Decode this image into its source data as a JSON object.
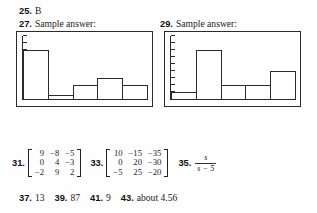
{
  "page": {
    "background_color": "#fefefe",
    "ink_color": "#1c1c1c"
  },
  "entries": {
    "e25": {
      "number": "25.",
      "answer": "B"
    },
    "e27": {
      "number": "27.",
      "answer": "Sample answer:"
    },
    "e29": {
      "number": "29.",
      "answer": "Sample answer:"
    },
    "e31": {
      "number": "31."
    },
    "e33": {
      "number": "33."
    },
    "e35": {
      "number": "35.",
      "numerator": "s",
      "denominator": "s − 5"
    },
    "e37": {
      "number": "37.",
      "answer": "13"
    },
    "e39": {
      "number": "39.",
      "answer": "87"
    },
    "e41": {
      "number": "41.",
      "answer": "9"
    },
    "e43": {
      "number": "43.",
      "answer": "about 4.56"
    }
  },
  "matrices": {
    "m31": {
      "rows": [
        [
          "9",
          "−8",
          "−5"
        ],
        [
          "0",
          "4",
          "−3"
        ],
        [
          "−2",
          "9",
          "2"
        ]
      ]
    },
    "m33": {
      "rows": [
        [
          "10",
          "−15",
          "−35"
        ],
        [
          "0",
          "20",
          "−30"
        ],
        [
          "−5",
          "25",
          "−20"
        ]
      ]
    }
  },
  "chart_data": [
    {
      "id": "hist-27",
      "type": "bar",
      "title": "27. Sample answer:",
      "categories": [
        "1",
        "2",
        "3",
        "4",
        "5"
      ],
      "values": [
        7,
        0.5,
        2,
        3,
        2
      ],
      "ylim": [
        0,
        9
      ],
      "xlabel": "",
      "ylabel": "",
      "grid": false,
      "legend": "none",
      "y_tick_count": 9,
      "bar_fill": "#ffffff",
      "bar_stroke": "#2b2b2b"
    },
    {
      "id": "hist-29",
      "type": "bar",
      "title": "29. Sample answer:",
      "categories": [
        "1",
        "2",
        "3",
        "4",
        "5"
      ],
      "values": [
        1,
        7,
        2,
        2,
        4
      ],
      "ylim": [
        0,
        9
      ],
      "xlabel": "",
      "ylabel": "",
      "grid": false,
      "legend": "none",
      "y_tick_count": 9,
      "bar_fill": "#ffffff",
      "bar_stroke": "#2b2b2b"
    }
  ]
}
